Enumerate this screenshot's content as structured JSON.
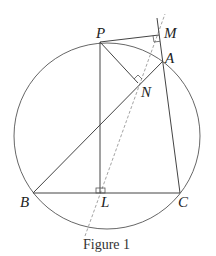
{
  "figure": {
    "caption": "Figure 1",
    "points": {
      "P": "P",
      "M": "M",
      "A": "A",
      "N": "N",
      "B": "B",
      "L": "L",
      "C": "C"
    }
  },
  "colors": {
    "stroke": "#444444",
    "dashed": "#999999"
  }
}
